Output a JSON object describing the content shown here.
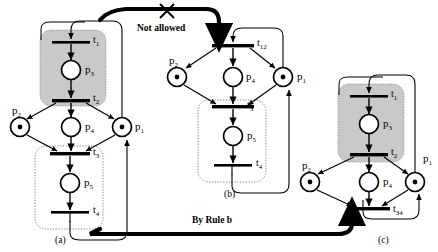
{
  "figure": {
    "type": "petri-net-reduction-diagram",
    "background": "#ffffff",
    "ink": "#000000",
    "shaded_region_fill": "#c8c8c8",
    "annotations": {
      "not_allowed": "Not allowed",
      "by_rule_b": "By Rule b"
    },
    "captions": {
      "a": "(a)",
      "b": "(b)",
      "c": "(c)"
    }
  },
  "nets": {
    "a": {
      "caption": "(a)",
      "places": [
        {
          "id": "p2",
          "label": "p",
          "sub": "2",
          "tokens": 1
        },
        {
          "id": "p4",
          "label": "p",
          "sub": "4",
          "tokens": 0
        },
        {
          "id": "p1",
          "label": "p",
          "sub": "1",
          "tokens": 1
        },
        {
          "id": "p3",
          "label": "p",
          "sub": "3",
          "tokens": 0
        },
        {
          "id": "p5",
          "label": "p",
          "sub": "5",
          "tokens": 0
        }
      ],
      "transitions": [
        {
          "id": "t1",
          "label": "t",
          "sub": "1"
        },
        {
          "id": "t2",
          "label": "t",
          "sub": "2"
        },
        {
          "id": "t3",
          "label": "t",
          "sub": "3"
        },
        {
          "id": "t4",
          "label": "t",
          "sub": "4"
        }
      ],
      "shaded_box": "t1-p3-t2",
      "dotted_box": "t3-p5-t4"
    },
    "b": {
      "caption": "(b)",
      "places": [
        {
          "id": "p2",
          "label": "p",
          "sub": "2",
          "tokens": 1
        },
        {
          "id": "p4",
          "label": "p",
          "sub": "4",
          "tokens": 0
        },
        {
          "id": "p1",
          "label": "p",
          "sub": "1",
          "tokens": 1
        },
        {
          "id": "p5",
          "label": "p",
          "sub": "5",
          "tokens": 0
        }
      ],
      "transitions": [
        {
          "id": "t12",
          "label": "t",
          "sub": "12"
        },
        {
          "id": "t3",
          "label": "t",
          "sub": "3"
        },
        {
          "id": "t4",
          "label": "t",
          "sub": "4"
        }
      ],
      "dotted_box": "t3-p5-t4"
    },
    "c": {
      "caption": "(c)",
      "places": [
        {
          "id": "p2",
          "label": "p",
          "sub": "2",
          "tokens": 1
        },
        {
          "id": "p4",
          "label": "p",
          "sub": "4",
          "tokens": 0
        },
        {
          "id": "p1",
          "label": "p",
          "sub": "1",
          "tokens": 1
        },
        {
          "id": "p3",
          "label": "p",
          "sub": "3",
          "tokens": 0
        }
      ],
      "transitions": [
        {
          "id": "t1",
          "label": "t",
          "sub": "1"
        },
        {
          "id": "t2",
          "label": "t",
          "sub": "2"
        },
        {
          "id": "t34",
          "label": "t",
          "sub": "34"
        }
      ],
      "shaded_box": "t1-p3-t2"
    }
  },
  "labels": {
    "a_t1": "t",
    "a_t1_sub": "1",
    "a_p3": "p",
    "a_p3_sub": "3",
    "a_t2": "t",
    "a_t2_sub": "2",
    "a_p2": "p",
    "a_p2_sub": "2",
    "a_p4": "p",
    "a_p4_sub": "4",
    "a_p1": "p",
    "a_p1_sub": "1",
    "a_t3": "t",
    "a_t3_sub": "3",
    "a_p5": "p",
    "a_p5_sub": "5",
    "a_t4": "t",
    "a_t4_sub": "4",
    "b_t12": "t",
    "b_t12_sub": "12",
    "b_p2": "p",
    "b_p2_sub": "2",
    "b_p4": "p",
    "b_p4_sub": "4",
    "b_p1": "p",
    "b_p1_sub": "1",
    "b_t3": "t",
    "b_t3_sub": "3",
    "b_p5": "p",
    "b_p5_sub": "5",
    "b_t4": "t",
    "b_t4_sub": "4",
    "c_t1": "t",
    "c_t1_sub": "1",
    "c_p3": "p",
    "c_p3_sub": "3",
    "c_t2": "t",
    "c_t2_sub": "2",
    "c_p2": "p",
    "c_p2_sub": "2",
    "c_p4": "p",
    "c_p4_sub": "4",
    "c_p1": "p",
    "c_p1_sub": "1",
    "c_t34": "t",
    "c_t34_sub": "34"
  }
}
